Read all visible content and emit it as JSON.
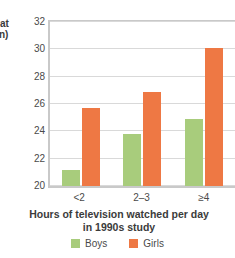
{
  "chart_data": {
    "type": "bar",
    "title": "",
    "categories": [
      "<2",
      "2–3",
      "≥4"
    ],
    "series": [
      {
        "name": "Boys",
        "color": "#a8cc7c",
        "values": [
          21.2,
          23.8,
          24.9
        ]
      },
      {
        "name": "Girls",
        "color": "#ee7844",
        "values": [
          25.7,
          26.9,
          30.1
        ]
      }
    ],
    "xlabel": "Hours of television watched per day in 1990s study",
    "xlabel_line1": "Hours of television watched per day",
    "xlabel_line2": "in 1990s study",
    "ylabel_cropped_line1": "at",
    "ylabel_cropped_line2": "n)",
    "ylabel_side_faint": "",
    "ylim": [
      20,
      32
    ],
    "yticks": [
      20,
      22,
      24,
      26,
      28,
      30,
      32
    ],
    "ytick_labels": [
      "20",
      "22",
      "24",
      "26",
      "28",
      "30",
      "32"
    ],
    "grid": true,
    "legend_position": "bottom"
  },
  "colors": {
    "boys": "#a8cc7c",
    "girls": "#ee7844",
    "grid": "#d9d9d9",
    "axis": "#c9c9c9",
    "text": "#3b3b3b"
  },
  "legend": {
    "items": [
      {
        "label": "Boys"
      },
      {
        "label": "Girls"
      }
    ]
  }
}
